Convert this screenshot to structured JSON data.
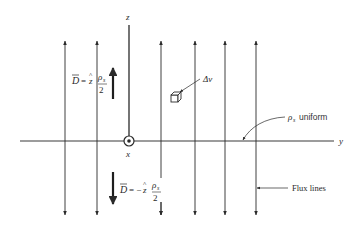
{
  "diagram": {
    "axes": {
      "z_label": "z",
      "x_label": "x",
      "y_label": "y"
    },
    "equations": {
      "upper": {
        "lhs": "D",
        "eq": "=",
        "unit": "z",
        "num": "ρ",
        "num_sub": "s",
        "den": "2"
      },
      "lower": {
        "lhs": "D",
        "eq": "= −",
        "unit": "z",
        "num": "ρ",
        "num_sub": "s",
        "den": "2"
      }
    },
    "annotations": {
      "volume_element": "Δv",
      "charge_label_symbol": "ρ",
      "charge_label_sub": "s",
      "charge_label_text": "uniform",
      "flux_lines": "Flux lines"
    },
    "flux_line_x": [
      65,
      97,
      161,
      195,
      225,
      256
    ],
    "colors": {
      "ink": "#2a2a2a",
      "background": "#ffffff"
    }
  }
}
